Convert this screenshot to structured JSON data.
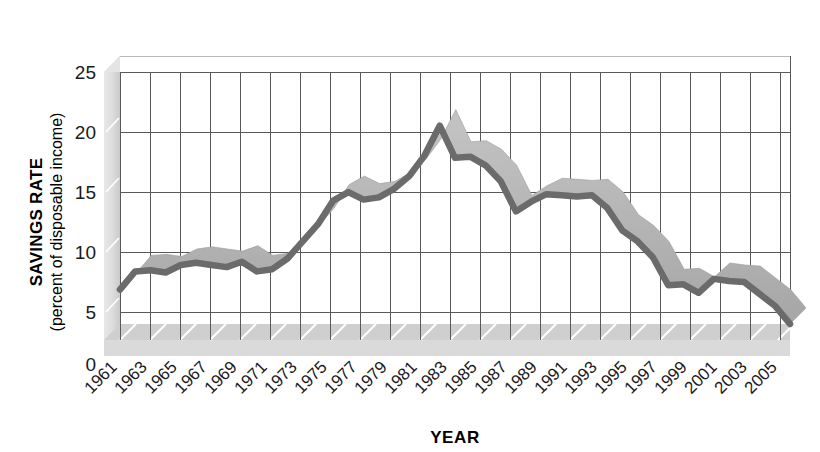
{
  "chart_data": {
    "type": "line",
    "title": "",
    "xlabel": "YEAR",
    "ylabel_main": "SAVINGS RATE",
    "ylabel_sub": "(percent of disposable income)",
    "ylim": [
      0,
      25
    ],
    "xlim": [
      1961,
      2005
    ],
    "y_ticks": [
      0,
      5,
      10,
      15,
      20,
      25
    ],
    "x_ticks": [
      "1961",
      "1963",
      "1965",
      "1967",
      "1969",
      "1971",
      "1973",
      "1975",
      "1977",
      "1979",
      "1981",
      "1983",
      "1985",
      "1987",
      "1989",
      "1991",
      "1993",
      "1995",
      "1997",
      "1999",
      "2001",
      "2003",
      "2005"
    ],
    "grid": true,
    "legend": "none",
    "style": "3d-ribbon",
    "colors": {
      "line_front": "#6b6b6b",
      "line_top": "#b5b5b5",
      "line_side": "#8f8f8f",
      "grid": "#5a5a5a",
      "wall": "#d8d8d8",
      "floor": "#c6c6c6",
      "plot_bg": "#ffffff",
      "text": "#1a1a1a"
    },
    "series": [
      {
        "name": "Savings rate",
        "x": [
          1961,
          1962,
          1963,
          1964,
          1965,
          1966,
          1967,
          1968,
          1969,
          1970,
          1971,
          1972,
          1973,
          1974,
          1975,
          1976,
          1977,
          1978,
          1979,
          1980,
          1981,
          1982,
          1983,
          1984,
          1985,
          1986,
          1987,
          1988,
          1989,
          1990,
          1991,
          1992,
          1993,
          1994,
          1995,
          1996,
          1997,
          1998,
          1999,
          2000,
          2001,
          2002,
          2003,
          2004,
          2005
        ],
        "values": [
          4.7,
          6.4,
          6.5,
          6.3,
          7.0,
          7.2,
          7.0,
          6.8,
          7.3,
          6.4,
          6.6,
          7.6,
          9.2,
          10.8,
          13.0,
          13.8,
          13.1,
          13.3,
          14.1,
          15.3,
          17.2,
          20.0,
          17.0,
          17.1,
          16.3,
          14.8,
          12.0,
          12.9,
          13.6,
          13.5,
          13.4,
          13.5,
          12.3,
          10.2,
          9.2,
          7.7,
          5.1,
          5.2,
          4.4,
          5.7,
          5.5,
          5.4,
          4.3,
          3.2,
          1.5
        ]
      }
    ]
  },
  "axis": {
    "y_title_main": "SAVINGS RATE",
    "y_title_sub": "(percent of disposable income)",
    "x_title": "YEAR"
  }
}
